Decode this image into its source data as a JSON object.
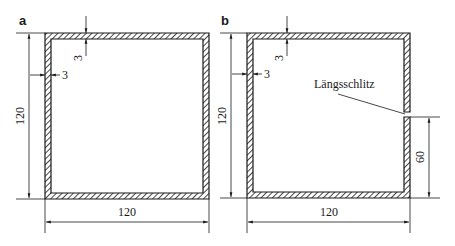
{
  "figure": {
    "panels": [
      {
        "id": "a",
        "label": "a",
        "height_dim": "120",
        "width_dim": "120",
        "wall_top_dim": "3",
        "wall_left_dim": "3"
      },
      {
        "id": "b",
        "label": "b",
        "height_dim": "120",
        "width_dim": "120",
        "wall_top_dim": "3",
        "wall_left_dim": "3",
        "slit_label": "Längsschlitz",
        "slit_height_dim": "60"
      }
    ],
    "colors": {
      "line": "#1a1a1a",
      "background": "#ffffff"
    }
  }
}
